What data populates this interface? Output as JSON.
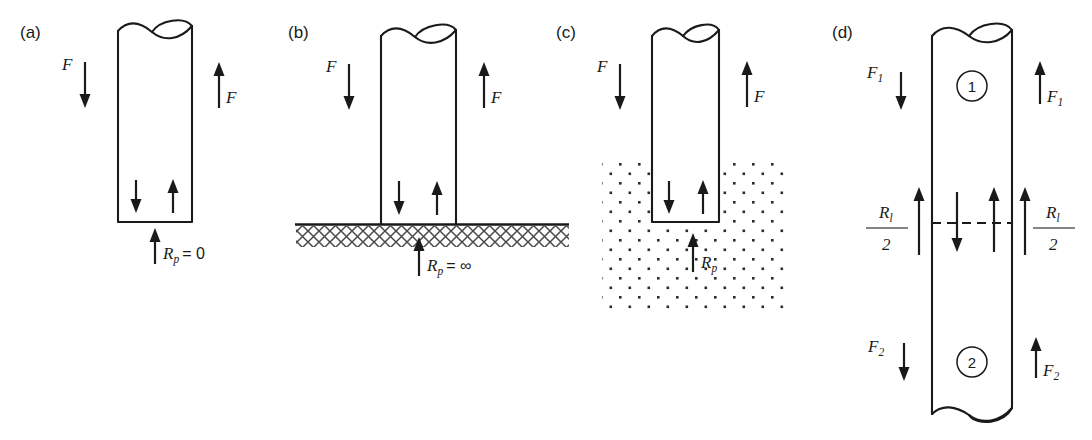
{
  "figure": {
    "background_color": "#ffffff",
    "line_color": "#1a1a1a",
    "soil_dot_color": "#2b2b2b",
    "hatch_color": "#4a4a4a",
    "width": 1092,
    "height": 440
  },
  "panels": [
    {
      "id": "a",
      "label": "(a)",
      "caption": "Floating pile, no end bearing",
      "base_condition": "free",
      "labels": {
        "left_force": "F",
        "right_force": "F",
        "base_reaction": "R",
        "base_reaction_sub": "p",
        "base_reaction_value": "= 0"
      },
      "arrows": {
        "left_outer": "down",
        "right_outer": "up",
        "inner_left": "down",
        "inner_right": "up",
        "base": "up"
      }
    },
    {
      "id": "b",
      "label": "(b)",
      "caption": "Pile on rigid stratum",
      "base_condition": "rigid-hatched-ground",
      "labels": {
        "left_force": "F",
        "right_force": "F",
        "base_reaction": "R",
        "base_reaction_sub": "p",
        "base_reaction_value": "= ∞"
      },
      "arrows": {
        "left_outer": "down",
        "right_outer": "up",
        "inner_left": "down",
        "inner_right": "up",
        "base": "up"
      }
    },
    {
      "id": "c",
      "label": "(c)",
      "caption": "Pile embedded in compressible soil",
      "base_condition": "dotted-soil",
      "labels": {
        "left_force": "F",
        "right_force": "F",
        "base_reaction": "R",
        "base_reaction_sub": "p",
        "base_reaction_value": ""
      },
      "arrows": {
        "left_outer": "down",
        "right_outer": "up",
        "inner_left": "down",
        "inner_right": "up",
        "base": "up"
      }
    },
    {
      "id": "d",
      "label": "(d)",
      "caption": "Pile split into two segments with interface shear",
      "base_condition": "continuous",
      "segments": [
        {
          "number": "1"
        },
        {
          "number": "2"
        }
      ],
      "labels": {
        "top_left_force": "F",
        "top_left_force_sub": "1",
        "top_right_force": "F",
        "top_right_force_sub": "1",
        "bottom_left_force": "F",
        "bottom_left_force_sub": "2",
        "bottom_right_force": "F",
        "bottom_right_force_sub": "2",
        "interface_left_numerator": "R",
        "interface_left_numerator_sub": "l",
        "interface_left_denominator": "2",
        "interface_right_numerator": "R",
        "interface_right_numerator_sub": "l",
        "interface_right_denominator": "2"
      },
      "arrows": {
        "top_left_outer": "down",
        "top_right_outer": "up",
        "interface_left_outer": "up",
        "interface_right_outer": "up",
        "interface_inner_down": "down",
        "interface_inner_up": "up",
        "bottom_left_outer": "down",
        "bottom_right_outer": "up"
      }
    }
  ]
}
